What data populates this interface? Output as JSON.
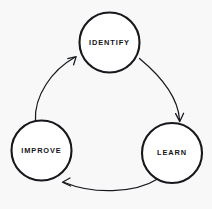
{
  "diagram": {
    "type": "cycle",
    "title": "",
    "background_color": "#f8f8f9",
    "stroke_color": "#16181c",
    "node_fill_color": "#ffffff",
    "text_color": "#14161a",
    "direction": "clockwise",
    "nodes": [
      {
        "id": "identify",
        "label": "IDENTIFY",
        "cx": 109.5,
        "cy": 42.5,
        "r": 30.0
      },
      {
        "id": "learn",
        "label": "LEARN",
        "cx": 172.0,
        "cy": 153.0,
        "r": 30.0
      },
      {
        "id": "improve",
        "label": "IMPROVE",
        "cx": 41.5,
        "cy": 150.5,
        "r": 30.0
      }
    ],
    "arrows": [
      {
        "id": "identify-to-learn",
        "from": "identify",
        "to": "learn",
        "path": "M 139.5 58.5 C 163 78 178 98 179.5 119.5",
        "head": "M 175.6 113.6 L 179.8 121.6 L 183.6 113.2"
      },
      {
        "id": "learn-to-improve",
        "from": "learn",
        "to": "improve",
        "path": "M 158.5 178.5 C 134 194 92 194 64.5 182.5",
        "head": "M 70.6 186.0 L 62.4 182.2 L 70.0 178.0"
      },
      {
        "id": "improve-to-identify",
        "from": "improve",
        "to": "identify",
        "path": "M 35.5 120.5 C 34 96 52 70 74.5 57.5",
        "head": "M 67.8 58.6 L 76.2 56.6 L 73.6 64.8"
      }
    ]
  }
}
